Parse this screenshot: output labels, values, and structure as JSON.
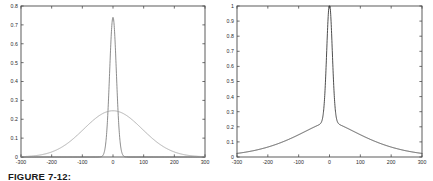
{
  "caption": {
    "text": "FIGURE 7-12:"
  },
  "chart_data": [
    {
      "id": "left",
      "type": "line",
      "title": "",
      "xlabel": "",
      "ylabel": "",
      "xlim": [
        -300,
        300
      ],
      "ylim": [
        0,
        0.8
      ],
      "xticks": [
        -300,
        -200,
        -100,
        0,
        100,
        200,
        300
      ],
      "xtick_labels": [
        "-300",
        "-200",
        "-100",
        "0",
        "100",
        "200",
        "300"
      ],
      "yticks": [
        0,
        0.1,
        0.2,
        0.3,
        0.4,
        0.5,
        0.6,
        0.7,
        0.8
      ],
      "ytick_labels": [
        "0",
        "0.1",
        "0.2",
        "0.3",
        "0.4",
        "0.5",
        "0.6",
        "0.7",
        "0.8"
      ],
      "grid": false,
      "legend": "none",
      "series": [
        {
          "name": "narrow-peak",
          "color": "#6e6e6e",
          "width": 0.8,
          "peak_x": 0,
          "peak_y": 0.74,
          "shape": "gaussian",
          "sigma": 11,
          "baseline": 0.0
        },
        {
          "name": "broad-peak",
          "color": "#9a9a9a",
          "width": 0.8,
          "peak_x": 0,
          "peak_y": 0.245,
          "shape": "gaussian",
          "sigma": 95,
          "baseline": 0.0
        }
      ]
    },
    {
      "id": "right",
      "type": "line",
      "title": "",
      "xlabel": "",
      "ylabel": "",
      "xlim": [
        -300,
        300
      ],
      "ylim": [
        0,
        1
      ],
      "xticks": [
        -300,
        -200,
        -100,
        0,
        100,
        200,
        300
      ],
      "xtick_labels": [
        "-300",
        "-200",
        "-100",
        "0",
        "100",
        "200",
        "300"
      ],
      "yticks": [
        0,
        0.1,
        0.2,
        0.3,
        0.4,
        0.5,
        0.6,
        0.7,
        0.8,
        0.9,
        1
      ],
      "ytick_labels": [
        "0",
        "0.1",
        "0.2",
        "0.3",
        "0.4",
        "0.5",
        "0.6",
        "0.7",
        "0.8",
        "0.9",
        "1"
      ],
      "grid": false,
      "legend": "none",
      "series": [
        {
          "name": "cusp-curve",
          "color": "#3a3a3a",
          "width": 0.9,
          "peak_x": 0,
          "peak_y": 1.0,
          "shape": "spike-plus-broad",
          "spike_sigma": 9,
          "spike_amp": 0.78,
          "broad_sigma": 105,
          "broad_amp": 0.235,
          "shoulder_y": 0.235,
          "baseline": 0.0
        }
      ]
    }
  ]
}
